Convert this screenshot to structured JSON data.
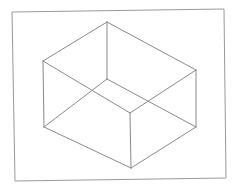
{
  "figure": {
    "type": "wireframe-cuboid",
    "width": 239,
    "height": 190,
    "background": "#ffffff",
    "line_color": "#8a8a8a",
    "frame_color": "#9a9a9a",
    "line_width": 1,
    "frame": {
      "points": [
        [
          12,
          12
        ],
        [
          224,
          9
        ],
        [
          226,
          178
        ],
        [
          15,
          181
        ]
      ]
    },
    "vertices": {
      "top_back": [
        107,
        22
      ],
      "top_left": [
        43,
        61
      ],
      "top_right": [
        196,
        70
      ],
      "top_front": [
        130,
        113
      ],
      "bottom_back": [
        107,
        79
      ],
      "bottom_left": [
        44,
        127
      ],
      "bottom_right": [
        196,
        127
      ],
      "bottom_front": [
        131,
        168
      ]
    },
    "edges": [
      [
        "top_back",
        "top_left"
      ],
      [
        "top_back",
        "top_right"
      ],
      [
        "top_left",
        "top_front"
      ],
      [
        "top_right",
        "top_front"
      ],
      [
        "top_left",
        "bottom_left"
      ],
      [
        "top_right",
        "bottom_right"
      ],
      [
        "top_front",
        "bottom_front"
      ],
      [
        "top_back",
        "bottom_back"
      ],
      [
        "bottom_left",
        "bottom_front"
      ],
      [
        "bottom_right",
        "bottom_front"
      ],
      [
        "bottom_left",
        "bottom_back"
      ],
      [
        "bottom_right",
        "bottom_back"
      ]
    ]
  }
}
